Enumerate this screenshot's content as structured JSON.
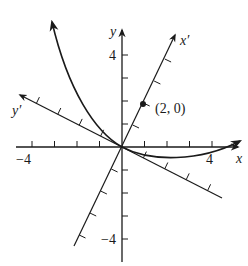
{
  "figure": {
    "type": "rotated-axes-parabola",
    "colors": {
      "ink": "#1a1a1a",
      "background": "#ffffff"
    },
    "origin_px": [
      122,
      147
    ],
    "unit_px": 22.5,
    "axes": {
      "x": {
        "label": "x",
        "tick_label_pos": "4",
        "tick_label_neg": "−4"
      },
      "y": {
        "label": "y",
        "tick_label_pos": "4",
        "tick_label_neg": "−4"
      },
      "x_prime": {
        "label": "x′"
      },
      "y_prime": {
        "label": "y′"
      }
    },
    "point": {
      "label": "(2, 0)",
      "frame": "x'y'",
      "coords": [
        2,
        0
      ]
    },
    "curve": {
      "description": "parabola opening along the y' direction, passing through origin, arrows at both ends"
    }
  }
}
